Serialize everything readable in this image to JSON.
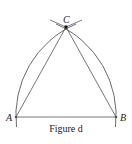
{
  "figure": {
    "caption": "Figure d",
    "points": {
      "A": {
        "label": "A",
        "x": 16,
        "y": 117
      },
      "B": {
        "label": "B",
        "x": 116,
        "y": 117
      },
      "C": {
        "label": "C",
        "x": 66,
        "y": 27
      }
    },
    "colors": {
      "line": "#555555",
      "arc": "#444444",
      "point": "#111111"
    }
  }
}
